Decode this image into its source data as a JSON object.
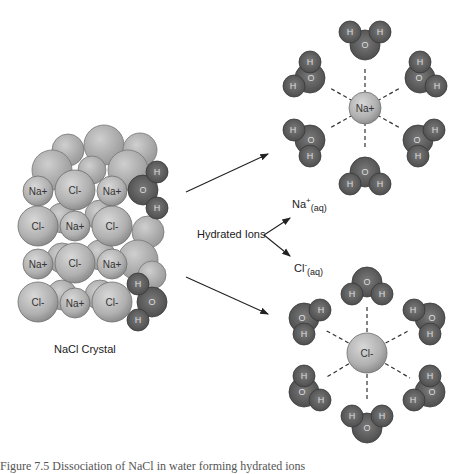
{
  "figure": {
    "crystal_label": "NaCl Crystal",
    "hydrated_label": "Hydrated Ions",
    "sodium_aq": {
      "base": "Na",
      "sup": "+",
      "sub": "(aq)"
    },
    "chloride_aq": {
      "base": "Cl",
      "sup": "-",
      "sub": "(aq)"
    },
    "sodium_center": "Na+",
    "chloride_center": "Cl-",
    "caption": "Figure 7.5 Dissociation of NaCl in water forming hydrated ions"
  },
  "crystal_grid": [
    [
      "Na+",
      "Cl-",
      "Na+"
    ],
    [
      "Cl-",
      "Na+",
      "Cl-"
    ],
    [
      "Na+",
      "Cl-",
      "Na+"
    ],
    [
      "Cl-",
      "Na+",
      "Cl-"
    ]
  ],
  "atoms": {
    "hydrogen": "H",
    "oxygen": "O"
  },
  "colors": {
    "ion_fill": "#b5b5b5",
    "ion_stroke": "#6e6e6e",
    "water_fill": "#5a5a5a",
    "water_stroke": "#3a3a3a",
    "text": "#222222"
  }
}
